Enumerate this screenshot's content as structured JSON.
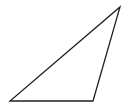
{
  "diagram": {
    "type": "triangle",
    "stroke_color": "#222222",
    "fill_color": "none",
    "vertices": [
      {
        "name": "A",
        "label": ""
      },
      {
        "name": "B",
        "label": ""
      },
      {
        "name": "C",
        "label": ""
      }
    ]
  }
}
